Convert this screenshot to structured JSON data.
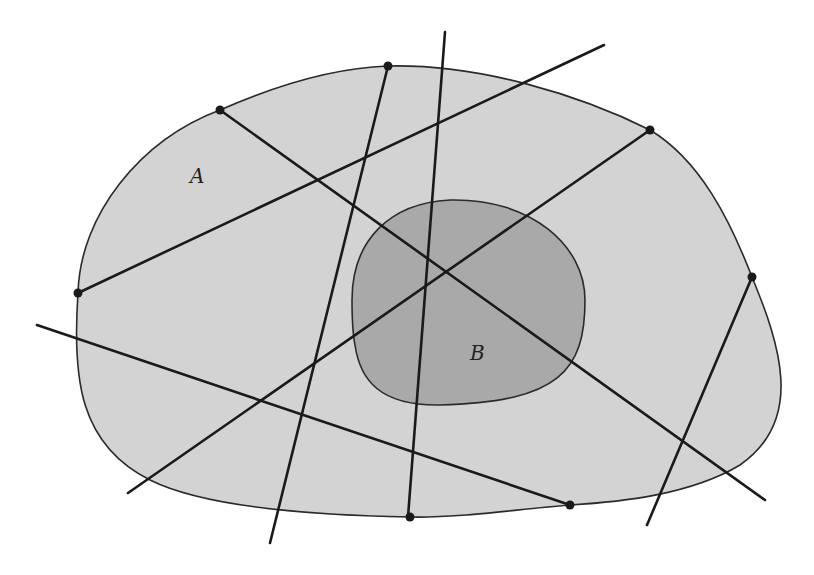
{
  "diagram": {
    "regions": [
      {
        "id": "A",
        "label": "A",
        "fill": "#d3d3d3",
        "label_pos": [
          190,
          183
        ]
      },
      {
        "id": "B",
        "label": "B",
        "fill": "#a9a9a9",
        "label_pos": [
          470,
          360
        ]
      }
    ],
    "lines": [
      {
        "from": [
          78,
          293
        ],
        "to": [
          604,
          45
        ]
      },
      {
        "from": [
          220,
          110
        ],
        "to": [
          765,
          500
        ]
      },
      {
        "from": [
          388,
          66
        ],
        "to": [
          270,
          543
        ]
      },
      {
        "from": [
          445,
          32
        ],
        "to": [
          408,
          517
        ]
      },
      {
        "from": [
          650,
          130
        ],
        "to": [
          128,
          493
        ]
      },
      {
        "from": [
          752,
          277
        ],
        "to": [
          647,
          525
        ]
      },
      {
        "from": [
          37,
          325
        ],
        "to": [
          570,
          505
        ]
      }
    ],
    "boundary_points": [
      [
        78,
        293
      ],
      [
        220,
        110
      ],
      [
        388,
        66
      ],
      [
        650,
        130
      ],
      [
        752,
        277
      ],
      [
        570,
        505
      ],
      [
        410,
        517
      ]
    ],
    "colors": {
      "stroke": "#1a1a1a",
      "region_a": "#d3d3d3",
      "region_b": "#a9a9a9"
    }
  }
}
